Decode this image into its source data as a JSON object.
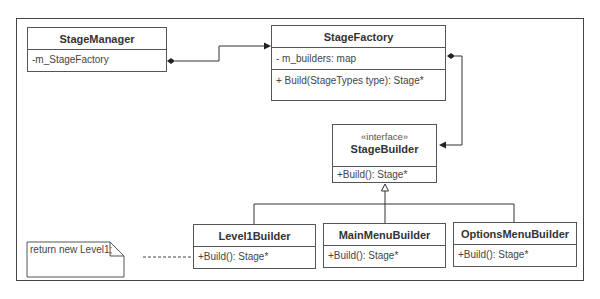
{
  "diagram": {
    "type": "UML class diagram",
    "classes": [
      {
        "id": "stage_manager",
        "name": "StageManager",
        "attributes": [
          "-m_StageFactory"
        ],
        "operations": []
      },
      {
        "id": "stage_factory",
        "name": "StageFactory",
        "attributes": [
          "- m_builders: map"
        ],
        "operations": [
          "+ Build(StageTypes type): Stage*"
        ]
      },
      {
        "id": "stage_builder",
        "stereotype": "«interface»",
        "name": "StageBuilder",
        "attributes": [],
        "operations": [
          "+Build(): Stage*"
        ]
      },
      {
        "id": "level1_builder",
        "name": "Level1Builder",
        "operations": [
          "+Build(): Stage*"
        ]
      },
      {
        "id": "main_menu_builder",
        "name": "MainMenuBuilder",
        "operations": [
          "+Build(): Stage*"
        ]
      },
      {
        "id": "options_menu_builder",
        "name": "OptionsMenuBuilder",
        "operations": [
          "+Build(): Stage*"
        ]
      }
    ],
    "note": {
      "text": "return new Level1;",
      "attached_to": "Level1Builder"
    },
    "relations": [
      {
        "from": "StageManager",
        "to": "StageFactory",
        "kind": "composition-association"
      },
      {
        "from": "StageFactory",
        "to": "StageBuilder",
        "kind": "composition-association"
      },
      {
        "from": "Level1Builder",
        "to": "StageBuilder",
        "kind": "realization"
      },
      {
        "from": "MainMenuBuilder",
        "to": "StageBuilder",
        "kind": "realization"
      },
      {
        "from": "OptionsMenuBuilder",
        "to": "StageBuilder",
        "kind": "realization"
      }
    ]
  }
}
